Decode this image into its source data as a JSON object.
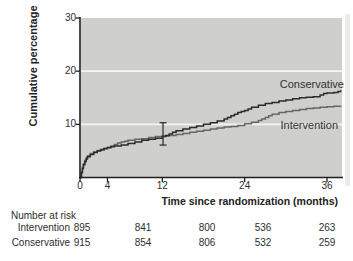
{
  "chart_data": {
    "type": "line",
    "subtype": "kaplan-meier-step",
    "title": "",
    "xlabel": "Time since randomization (months)",
    "ylabel": "Cumulative percentage",
    "xlim": [
      0,
      38.2
    ],
    "ylim": [
      0,
      30
    ],
    "x_ticks": [
      0,
      4,
      12,
      24,
      36
    ],
    "y_ticks": [
      30,
      20,
      10
    ],
    "gridlines_y": [
      10,
      20
    ],
    "legend_position": "labels-inside-plot-right",
    "colors": {
      "plot_bg": "#cfcfcb",
      "grid": "#f5f5f2",
      "axis": "#1f1f1f",
      "error_bar": "#333333"
    },
    "series": [
      {
        "name": "Conservative",
        "color": "#2b2b2b",
        "points": [
          [
            0,
            0
          ],
          [
            0.2,
            0.9
          ],
          [
            0.35,
            1.7
          ],
          [
            0.5,
            2.4
          ],
          [
            0.7,
            3.0
          ],
          [
            0.9,
            3.5
          ],
          [
            1.1,
            3.9
          ],
          [
            1.5,
            4.3
          ],
          [
            2,
            4.7
          ],
          [
            2.5,
            5.0
          ],
          [
            3,
            5.2
          ],
          [
            3.5,
            5.4
          ],
          [
            4,
            5.6
          ],
          [
            4.5,
            5.8
          ],
          [
            5,
            5.9
          ],
          [
            6,
            6.1
          ],
          [
            7,
            6.4
          ],
          [
            8,
            6.7
          ],
          [
            9,
            7.0
          ],
          [
            10,
            7.2
          ],
          [
            11,
            7.4
          ],
          [
            12,
            7.7
          ],
          [
            12.5,
            7.9
          ],
          [
            13,
            8.2
          ],
          [
            13.5,
            8.5
          ],
          [
            14,
            8.8
          ],
          [
            15,
            9.1
          ],
          [
            16,
            9.4
          ],
          [
            17,
            9.7
          ],
          [
            18,
            10.0
          ],
          [
            19,
            10.3
          ],
          [
            20,
            10.6
          ],
          [
            21,
            11.0
          ],
          [
            21.5,
            11.3
          ],
          [
            22,
            11.6
          ],
          [
            22.5,
            11.9
          ],
          [
            23,
            12.2
          ],
          [
            23.5,
            12.4
          ],
          [
            24,
            12.6
          ],
          [
            24.5,
            12.9
          ],
          [
            25,
            13.2
          ],
          [
            26,
            13.6
          ],
          [
            27,
            13.9
          ],
          [
            28,
            14.1
          ],
          [
            29,
            14.4
          ],
          [
            30,
            14.6
          ],
          [
            31,
            14.8
          ],
          [
            32,
            15.0
          ],
          [
            33,
            15.1
          ],
          [
            34,
            15.2
          ],
          [
            35,
            15.5
          ],
          [
            35.5,
            15.8
          ],
          [
            36,
            15.9
          ],
          [
            37,
            16.0
          ],
          [
            37.6,
            16.2
          ],
          [
            38,
            16.4
          ]
        ]
      },
      {
        "name": "Intervention",
        "color": "#686862",
        "points": [
          [
            0,
            0
          ],
          [
            0.2,
            1.1
          ],
          [
            0.35,
            1.9
          ],
          [
            0.5,
            2.6
          ],
          [
            0.7,
            3.2
          ],
          [
            0.9,
            3.7
          ],
          [
            1.1,
            4.1
          ],
          [
            1.5,
            4.5
          ],
          [
            2,
            4.8
          ],
          [
            2.5,
            5.1
          ],
          [
            3,
            5.3
          ],
          [
            3.5,
            5.5
          ],
          [
            4,
            5.7
          ],
          [
            4.5,
            5.9
          ],
          [
            5,
            6.2
          ],
          [
            5.5,
            6.5
          ],
          [
            6,
            6.7
          ],
          [
            6.5,
            6.8
          ],
          [
            7,
            7.0
          ],
          [
            8,
            7.2
          ],
          [
            9,
            7.3
          ],
          [
            10,
            7.5
          ],
          [
            11,
            7.7
          ],
          [
            12,
            7.8
          ],
          [
            13,
            7.9
          ],
          [
            14,
            8.1
          ],
          [
            15,
            8.3
          ],
          [
            16,
            8.5
          ],
          [
            17,
            8.7
          ],
          [
            18,
            8.9
          ],
          [
            19,
            9.1
          ],
          [
            20,
            9.3
          ],
          [
            21,
            9.5
          ],
          [
            22,
            9.6
          ],
          [
            23,
            9.8
          ],
          [
            24,
            10.1
          ],
          [
            25,
            10.4
          ],
          [
            26,
            10.7
          ],
          [
            26.5,
            11.0
          ],
          [
            27,
            11.3
          ],
          [
            27.5,
            11.6
          ],
          [
            28,
            11.9
          ],
          [
            29,
            12.2
          ],
          [
            30,
            12.4
          ],
          [
            31,
            12.6
          ],
          [
            32,
            12.8
          ],
          [
            33,
            13.0
          ],
          [
            34,
            13.1
          ],
          [
            35,
            13.2
          ],
          [
            36,
            13.3
          ],
          [
            37,
            13.4
          ],
          [
            38,
            13.5
          ]
        ]
      }
    ],
    "error_bar": {
      "x": 12.1,
      "y_low": 6.1,
      "y_high": 10.3
    }
  },
  "risk_table": {
    "title": "Number at risk",
    "rows": [
      {
        "label": "Intervention",
        "values": [
          "895",
          "841",
          "800",
          "536",
          "263"
        ]
      },
      {
        "label": "Conservative",
        "values": [
          "915",
          "854",
          "806",
          "532",
          "259"
        ]
      }
    ]
  }
}
